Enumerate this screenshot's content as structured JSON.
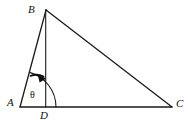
{
  "figure": {
    "kind": "geometry-diagram",
    "background_color": "#ffffff",
    "stroke_color": "#1a1a1a",
    "fill_color": "#111111",
    "labels": {
      "a": "A",
      "b": "B",
      "c": "C",
      "d": "D",
      "theta": "θ"
    },
    "points": {
      "A": {
        "x": 20,
        "y": 107
      },
      "B": {
        "x": 46,
        "y": 10
      },
      "C": {
        "x": 172,
        "y": 107
      },
      "D": {
        "x": 45.5,
        "y": 107
      }
    },
    "segments": [
      {
        "name": "AB",
        "from": "A",
        "to": "B"
      },
      {
        "name": "BC",
        "from": "B",
        "to": "C"
      },
      {
        "name": "AC",
        "from": "A",
        "to": "C"
      },
      {
        "name": "BD",
        "from": "B",
        "to": "D"
      }
    ],
    "arcs": [
      {
        "name": "theta-arc",
        "center": "A",
        "radius": 36,
        "note": "large arc from AB to AC at vertex A"
      },
      {
        "name": "angle-arrow-arc",
        "center": "A",
        "radius": 33,
        "note": "short arc with solid arrowhead pointing toward BD"
      }
    ]
  }
}
